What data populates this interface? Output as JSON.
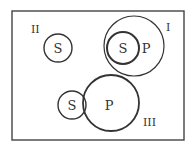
{
  "diagram": {
    "type": "euler",
    "colors": {
      "stroke": "#333333",
      "background": "#ffffff"
    },
    "cases": [
      {
        "id": "II",
        "label": "II",
        "description": "S only",
        "circles": [
          {
            "label": "S"
          }
        ]
      },
      {
        "id": "I",
        "label": "I",
        "description": "S inside P",
        "circles": [
          {
            "label": "S"
          },
          {
            "label": "P"
          }
        ]
      },
      {
        "id": "III",
        "label": "III",
        "description": "S overlaps P",
        "circles": [
          {
            "label": "S"
          },
          {
            "label": "P"
          }
        ]
      }
    ]
  }
}
